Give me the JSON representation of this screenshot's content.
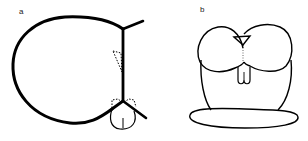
{
  "figure": {
    "panels": [
      {
        "id": "a",
        "label": "a",
        "description": "Cross-section outline: large rounded loop meeting a vertical wall, dotted triangular markers, small rounded lobe at bottom junction"
      },
      {
        "id": "b",
        "label": "b",
        "description": "Frontal view: two rounded lobes atop a column with small triangle at top center and small bilobed tab below, resting on an elliptical base"
      }
    ],
    "colors": {
      "stroke": "#000000",
      "background": "#ffffff"
    }
  }
}
